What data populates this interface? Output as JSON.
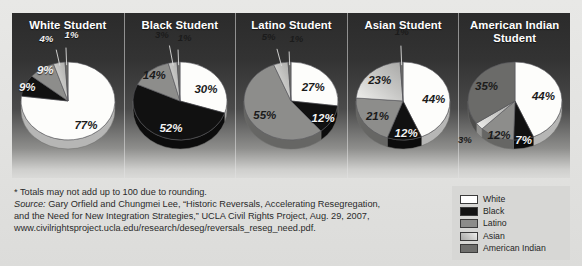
{
  "figure": {
    "columns": [
      {
        "title": "White Student"
      },
      {
        "title": "Black Student"
      },
      {
        "title": "Latino Student"
      },
      {
        "title": "Asian Student"
      },
      {
        "title": "American Indian\nStudent"
      }
    ]
  },
  "notes": {
    "footnote": "* Totals may not add up to 100 due to rounding.",
    "source_label": "Source:",
    "source_line1": " Gary Orfield and Chungmei Lee, “Historic Reversals, Accelerating Resegregation,",
    "source_line2": "and the Need for New Integration Strategies,” UCLA Civil Rights Project, Aug. 29, 2007,",
    "source_line3": "www.civilrightsproject.ucla.edu/research/deseg/reversals_reseg_need.pdf."
  },
  "legend": {
    "position": "bottom-right",
    "items": [
      {
        "label": "White",
        "color": "#ffffff"
      },
      {
        "label": "Black",
        "color": "#131313"
      },
      {
        "label": "Latino",
        "color": "#8c8c8a"
      },
      {
        "label": "Asian",
        "color": "#c4c4c2"
      },
      {
        "label": "American Indian",
        "color": "#6f6f6d"
      }
    ]
  },
  "colors": {
    "white": "#fdfdfb",
    "black": "#111111",
    "latino": "#8d8d8b",
    "asian": "#c9c9c7",
    "american_indian": "#6b6b69",
    "panel_top": "#2b2b2b",
    "panel_bottom": "#dadad8",
    "page_bg": "#e5e5e3"
  },
  "chart_data": [
    {
      "type": "pie",
      "title": "White Student",
      "labels": [
        "White",
        "Black",
        "Latino",
        "Asian",
        "American Indian"
      ],
      "values": [
        77,
        9,
        9,
        4,
        1
      ],
      "value_labels": [
        "77%",
        "9%",
        "9%",
        "4%",
        "1%"
      ],
      "colors": [
        "#fdfdfb",
        "#111111",
        "#8d8d8b",
        "#c9c9c7",
        "#6b6b69"
      ],
      "start_angle_deg": 0,
      "direction": "clockwise"
    },
    {
      "type": "pie",
      "title": "Black Student",
      "labels": [
        "White",
        "Black",
        "Latino",
        "Asian",
        "American Indian"
      ],
      "values": [
        30,
        52,
        14,
        3,
        1
      ],
      "value_labels": [
        "30%",
        "52%",
        "14%",
        "3%",
        "1%"
      ],
      "colors": [
        "#fdfdfb",
        "#111111",
        "#8d8d8b",
        "#c9c9c7",
        "#6b6b69"
      ],
      "start_angle_deg": 0,
      "direction": "clockwise"
    },
    {
      "type": "pie",
      "title": "Latino Student",
      "labels": [
        "White",
        "Black",
        "Latino",
        "Asian",
        "American Indian"
      ],
      "values": [
        27,
        12,
        55,
        5,
        1
      ],
      "value_labels": [
        "27%",
        "12%",
        "55%",
        "5%",
        "1%"
      ],
      "colors": [
        "#fdfdfb",
        "#111111",
        "#8d8d8b",
        "#c9c9c7",
        "#6b6b69"
      ],
      "start_angle_deg": 0,
      "direction": "clockwise"
    },
    {
      "type": "pie",
      "title": "Asian Student",
      "labels": [
        "White",
        "Black",
        "Latino",
        "Asian",
        "American Indian"
      ],
      "values": [
        44,
        12,
        21,
        23,
        1
      ],
      "value_labels": [
        "44%",
        "12%",
        "21%",
        "23%",
        "1%"
      ],
      "colors": [
        "#fdfdfb",
        "#111111",
        "#8d8d8b",
        "#c9c9c7",
        "#6b6b69"
      ],
      "start_angle_deg": 0,
      "direction": "clockwise"
    },
    {
      "type": "pie",
      "title": "American Indian Student",
      "labels": [
        "White",
        "Black",
        "Latino",
        "Asian",
        "American Indian"
      ],
      "values": [
        44,
        7,
        12,
        3,
        35
      ],
      "value_labels": [
        "44%",
        "7%",
        "12%",
        "3%",
        "35%"
      ],
      "colors": [
        "#fdfdfb",
        "#111111",
        "#8d8d8b",
        "#c9c9c7",
        "#6b6b69"
      ],
      "start_angle_deg": 0,
      "direction": "clockwise"
    }
  ]
}
